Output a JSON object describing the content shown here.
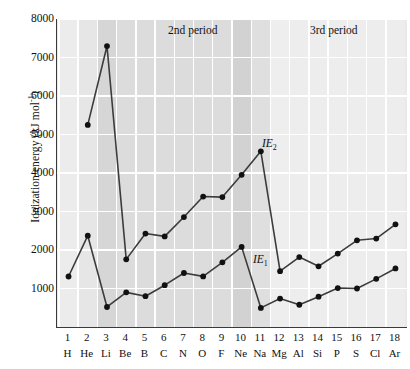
{
  "chart_data": {
    "type": "line",
    "title": "",
    "xlabel": "",
    "ylabel": "Ionization energy (kJ mol",
    "ylabel_sup": "-1",
    "ylabel_close": ")",
    "ylim": [
      0,
      8000
    ],
    "xlim": [
      0.4,
      18.6
    ],
    "yticks": [
      1000,
      2000,
      3000,
      4000,
      5000,
      6000,
      7000,
      8000
    ],
    "ytick_labels": [
      "1000",
      "2000",
      "3000",
      "4000",
      "5000",
      "6000",
      "7000",
      "8000"
    ],
    "grid": "horizontal-and-vertical-white",
    "legend": "inline-annotations",
    "atomic_numbers": [
      1,
      2,
      3,
      4,
      5,
      6,
      7,
      8,
      9,
      10,
      11,
      12,
      13,
      14,
      15,
      16,
      17,
      18
    ],
    "element_symbols": [
      "H",
      "He",
      "Li",
      "Be",
      "B",
      "C",
      "N",
      "O",
      "F",
      "Ne",
      "Na",
      "Mg",
      "Al",
      "Si",
      "P",
      "S",
      "Cl",
      "Ar"
    ],
    "series": [
      {
        "name": "IE1",
        "label": "IE",
        "label_sub": "1",
        "values": [
          1312,
          2372,
          520,
          900,
          800,
          1086,
          1402,
          1314,
          1681,
          2081,
          496,
          738,
          578,
          787,
          1012,
          1000,
          1251,
          1521
        ]
      },
      {
        "name": "IE2",
        "label": "IE",
        "label_sub": "2",
        "values": [
          null,
          5250,
          7298,
          1757,
          2427,
          2353,
          2856,
          3388,
          3374,
          3952,
          4562,
          1451,
          1817,
          1577,
          1907,
          2252,
          2298,
          2666
        ]
      }
    ],
    "annotations": [
      {
        "name": "period-2-label",
        "text": "2nd period"
      },
      {
        "name": "period-3-label",
        "text": "3rd period"
      }
    ],
    "band_shades": [
      "#ececec",
      "#e6e6e6",
      "#d6d6d6",
      "#dcdcdc",
      "#dcdcdc",
      "#dcdcdc",
      "#dcdcdc",
      "#dcdcdc",
      "#dcdcdc",
      "#d2d2d2",
      "#dfdfdf",
      "#eeeeee",
      "#ededed",
      "#ededed",
      "#ededed",
      "#ededed",
      "#ededed",
      "#ededed"
    ],
    "colors": {
      "line": "#3c3c3c",
      "marker": "#111111",
      "axis": "#3a3a3a",
      "gridline": "#ffffff",
      "plot_background": "#e9e9e9"
    }
  }
}
